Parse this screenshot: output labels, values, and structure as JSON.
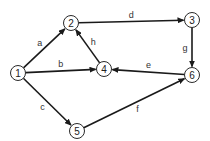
{
  "diagram": {
    "type": "directed-graph",
    "nodes": [
      {
        "id": "1",
        "label": "1",
        "x": 18,
        "y": 73
      },
      {
        "id": "2",
        "label": "2",
        "x": 71,
        "y": 23
      },
      {
        "id": "3",
        "label": "3",
        "x": 192,
        "y": 20
      },
      {
        "id": "4",
        "label": "4",
        "x": 104,
        "y": 69
      },
      {
        "id": "5",
        "label": "5",
        "x": 77,
        "y": 131
      },
      {
        "id": "6",
        "label": "6",
        "x": 192,
        "y": 75
      }
    ],
    "edges": [
      {
        "label": "a",
        "from": "1",
        "to": "2"
      },
      {
        "label": "b",
        "from": "1",
        "to": "4"
      },
      {
        "label": "c",
        "from": "1",
        "to": "5"
      },
      {
        "label": "d",
        "from": "2",
        "to": "3"
      },
      {
        "label": "e",
        "from": "6",
        "to": "4"
      },
      {
        "label": "f",
        "from": "5",
        "to": "6"
      },
      {
        "label": "g",
        "from": "3",
        "to": "6"
      },
      {
        "label": "h",
        "from": "4",
        "to": "2"
      }
    ]
  }
}
